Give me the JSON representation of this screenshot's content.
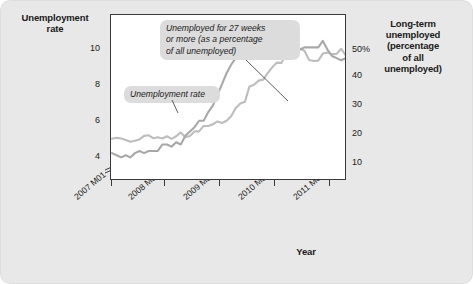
{
  "chart_data": {
    "type": "line",
    "title": "",
    "xlabel": "Year",
    "ylabel": "Unemployment rate",
    "y2label": "Long-term unemployed (percentage of all unemployed)",
    "grid": false,
    "legend_position": "inline-callouts",
    "x_tick_labels": [
      "2007 M01",
      "2008 M01",
      "2009 M01",
      "2010 M01",
      "2011 M01"
    ],
    "y_left_ticks": [
      "10",
      "8",
      "6",
      "4"
    ],
    "y_left_values": [
      10,
      8,
      6,
      4
    ],
    "y_right_ticks": [
      "50%",
      "40",
      "30",
      "20",
      "10"
    ],
    "y_right_values": [
      50,
      40,
      30,
      20,
      10
    ],
    "ylim_left": [
      3.4,
      11.0
    ],
    "ylim_right": [
      5,
      56
    ],
    "axis_break_left": true,
    "series": [
      {
        "name": "Unemployment rate",
        "axis": "left",
        "color": "#a8a8a8",
        "x": [
          "2007 M01",
          "2007 M02",
          "2007 M03",
          "2007 M04",
          "2007 M05",
          "2007 M06",
          "2007 M07",
          "2007 M08",
          "2007 M09",
          "2007 M10",
          "2007 M11",
          "2007 M12",
          "2008 M01",
          "2008 M02",
          "2008 M03",
          "2008 M04",
          "2008 M05",
          "2008 M06",
          "2008 M07",
          "2008 M08",
          "2008 M09",
          "2008 M10",
          "2008 M11",
          "2008 M12",
          "2009 M01",
          "2009 M02",
          "2009 M03",
          "2009 M04",
          "2009 M05",
          "2009 M06",
          "2009 M07",
          "2009 M08",
          "2009 M09",
          "2009 M10",
          "2009 M11",
          "2009 M12",
          "2010 M01",
          "2010 M02",
          "2010 M03",
          "2010 M04",
          "2010 M05",
          "2010 M06",
          "2010 M07",
          "2010 M08",
          "2010 M09",
          "2010 M10",
          "2010 M11",
          "2010 M12",
          "2011 M01",
          "2011 M02",
          "2011 M03",
          "2011 M04",
          "2011 M05",
          "2011 M06",
          "2011 M07",
          "2011 M08",
          "2011 M09"
        ],
        "values": [
          4.6,
          4.5,
          4.4,
          4.5,
          4.4,
          4.6,
          4.7,
          4.6,
          4.7,
          4.7,
          4.7,
          5.0,
          5.0,
          4.9,
          5.1,
          5.0,
          5.4,
          5.6,
          5.8,
          6.1,
          6.1,
          6.5,
          6.8,
          7.3,
          7.8,
          8.3,
          8.7,
          9.0,
          9.4,
          9.5,
          9.5,
          9.6,
          9.8,
          10.0,
          9.9,
          9.9,
          9.8,
          9.8,
          9.9,
          9.9,
          9.6,
          9.4,
          9.5,
          9.5,
          9.5,
          9.5,
          9.8,
          9.4,
          9.1,
          9.0,
          8.9,
          9.0,
          9.0,
          9.1,
          9.1,
          9.1,
          9.0
        ]
      },
      {
        "name": "Unemployed for 27 weeks or more (as a percentage of all unemployed)",
        "axis": "right",
        "color": "#bdbdbd",
        "x": [
          "2007 M01",
          "2007 M02",
          "2007 M03",
          "2007 M04",
          "2007 M05",
          "2007 M06",
          "2007 M07",
          "2007 M08",
          "2007 M09",
          "2007 M10",
          "2007 M11",
          "2007 M12",
          "2008 M01",
          "2008 M02",
          "2008 M03",
          "2008 M04",
          "2008 M05",
          "2008 M06",
          "2008 M07",
          "2008 M08",
          "2008 M09",
          "2008 M10",
          "2008 M11",
          "2008 M12",
          "2009 M01",
          "2009 M02",
          "2009 M03",
          "2009 M04",
          "2009 M05",
          "2009 M06",
          "2009 M07",
          "2009 M08",
          "2009 M09",
          "2009 M10",
          "2009 M11",
          "2009 M12",
          "2010 M01",
          "2010 M02",
          "2010 M03",
          "2010 M04",
          "2010 M05",
          "2010 M06",
          "2010 M07",
          "2010 M08",
          "2010 M09",
          "2010 M10",
          "2010 M11",
          "2010 M12",
          "2011 M01",
          "2011 M02",
          "2011 M03",
          "2011 M04",
          "2011 M05",
          "2011 M06",
          "2011 M07",
          "2011 M08",
          "2011 M09"
        ],
        "values": [
          17.5,
          17.8,
          17.6,
          17.1,
          16.6,
          16.9,
          17.3,
          18.4,
          18.6,
          17.7,
          18.0,
          17.6,
          18.3,
          17.5,
          18.3,
          19.5,
          18.0,
          18.4,
          19.8,
          19.8,
          21.5,
          21.5,
          22.0,
          22.9,
          22.4,
          23.1,
          24.5,
          27.1,
          28.5,
          29.0,
          33.8,
          34.3,
          35.6,
          35.9,
          38.0,
          39.8,
          41.2,
          41.1,
          44.3,
          45.9,
          46.0,
          45.5,
          44.9,
          42.0,
          41.7,
          41.8,
          44.0,
          44.3,
          43.8,
          43.9,
          45.5,
          43.4,
          45.1,
          44.4,
          44.4,
          42.9,
          44.6
        ]
      }
    ],
    "annotations": [
      {
        "name": "unemployment-rate-callout",
        "text": "Unemployment rate",
        "points_to": "left-axis series"
      },
      {
        "name": "long-term-callout",
        "text": "Unemployed for 27 weeks or more (as a percentage of all unemployed)",
        "points_to": "right-axis series"
      }
    ]
  },
  "labels": {
    "y_left_title": "Unemployment\nrate",
    "y_left_title_line1": "Unemployment",
    "y_left_title_line2": "rate",
    "y_right_title_line1": "Long-term",
    "y_right_title_line2": "unemployed",
    "y_right_title_line3": "(percentage",
    "y_right_title_line4": "of all",
    "y_right_title_line5": "unemployed)",
    "x_title": "Year",
    "callout_longterm_line1": "Unemployed for 27 weeks",
    "callout_longterm_line2": "or more (as a percentage",
    "callout_longterm_line3": "of all unemployed)",
    "callout_unrate": "Unemployment rate",
    "y_left_tick_10": "10",
    "y_left_tick_8": "8",
    "y_left_tick_6": "6",
    "y_left_tick_4": "4",
    "y_right_tick_50": "50%",
    "y_right_tick_40": "40",
    "y_right_tick_30": "30",
    "y_right_tick_20": "20",
    "y_right_tick_10": "10",
    "x_tick_1": "2007 M01",
    "x_tick_2": "2008 M01",
    "x_tick_3": "2009 M01",
    "x_tick_4": "2010 M01",
    "x_tick_5": "2011 M01"
  },
  "colors": {
    "background": "#e8e8e8",
    "plot_background": "#ffffff",
    "axis": "#3a3a3a",
    "series_unemployment_rate": "#a8a8a8",
    "series_long_term": "#bdbdbd",
    "callout_background": "#dcdcdc",
    "text": "#1a1a1a"
  }
}
